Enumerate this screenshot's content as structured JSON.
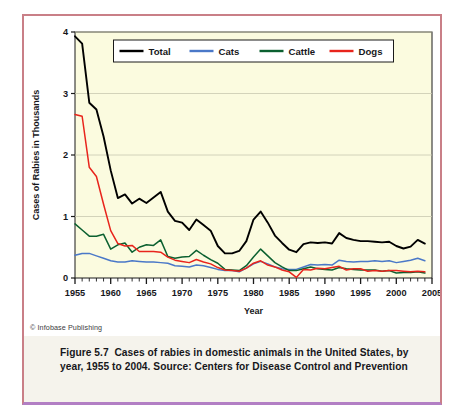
{
  "figure": {
    "label": "Figure 5.7",
    "caption": "Cases of rabies in domestic animals in the United States, by year, 1955 to 2004. Source: Centers for Disease Control and Prevention",
    "copyright": "© Infobase Publishing"
  },
  "colors": {
    "total": "#000000",
    "cats": "#4a78c8",
    "cattle": "#0b6030",
    "dogs": "#e8241c",
    "plot_background": "#fbfbdf",
    "gridline": "#c9c9b0",
    "axis": "#1a1a1a",
    "card_border": "#c97f87",
    "card_border_bottom": "#b27fc4",
    "caption_background": "#f5f3ec"
  },
  "chart_data": {
    "type": "line",
    "title": "",
    "xlabel": "Year",
    "ylabel": "Cases of Rabies in Thousands",
    "xlim": [
      1955,
      2005
    ],
    "ylim": [
      0,
      4
    ],
    "xticks": [
      1955,
      1960,
      1965,
      1970,
      1975,
      1980,
      1985,
      1990,
      1995,
      2000,
      2005
    ],
    "xtick_labels": [
      "1955",
      "1960",
      "1965",
      "1970",
      "1975",
      "1980",
      "1985",
      "1990",
      "1995",
      "2000",
      "2005"
    ],
    "yticks": [
      0,
      1,
      2,
      3,
      4
    ],
    "ytick_labels": [
      "0",
      "1",
      "2",
      "3",
      "4"
    ],
    "minor_xtick_interval": 1,
    "grid": "horizontal",
    "legend_position": "top-center",
    "x": [
      1955,
      1956,
      1957,
      1958,
      1959,
      1960,
      1961,
      1962,
      1963,
      1964,
      1965,
      1966,
      1967,
      1968,
      1969,
      1970,
      1971,
      1972,
      1973,
      1974,
      1975,
      1976,
      1977,
      1978,
      1979,
      1980,
      1981,
      1982,
      1983,
      1984,
      1985,
      1986,
      1987,
      1988,
      1989,
      1990,
      1991,
      1992,
      1993,
      1994,
      1995,
      1996,
      1997,
      1998,
      1999,
      2000,
      2001,
      2002,
      2003,
      2004
    ],
    "series": [
      {
        "name": "Total",
        "color": "#000000",
        "values": [
          3.93,
          3.81,
          2.85,
          2.74,
          2.3,
          1.75,
          1.3,
          1.36,
          1.21,
          1.29,
          1.22,
          1.31,
          1.4,
          1.08,
          0.93,
          0.9,
          0.78,
          0.95,
          0.86,
          0.77,
          0.52,
          0.4,
          0.4,
          0.44,
          0.6,
          0.95,
          1.08,
          0.9,
          0.69,
          0.57,
          0.46,
          0.42,
          0.55,
          0.58,
          0.57,
          0.58,
          0.56,
          0.73,
          0.65,
          0.62,
          0.6,
          0.6,
          0.59,
          0.58,
          0.59,
          0.52,
          0.48,
          0.51,
          0.62,
          0.56
        ]
      },
      {
        "name": "Cats",
        "color": "#4a78c8",
        "values": [
          0.37,
          0.4,
          0.4,
          0.36,
          0.32,
          0.28,
          0.26,
          0.26,
          0.28,
          0.27,
          0.26,
          0.26,
          0.25,
          0.24,
          0.2,
          0.19,
          0.18,
          0.21,
          0.2,
          0.17,
          0.14,
          0.12,
          0.12,
          0.1,
          0.16,
          0.23,
          0.27,
          0.23,
          0.18,
          0.15,
          0.14,
          0.14,
          0.18,
          0.22,
          0.21,
          0.22,
          0.21,
          0.29,
          0.27,
          0.26,
          0.27,
          0.27,
          0.28,
          0.27,
          0.28,
          0.25,
          0.27,
          0.29,
          0.32,
          0.28
        ]
      },
      {
        "name": "Cattle",
        "color": "#0b6030",
        "values": [
          0.88,
          0.78,
          0.68,
          0.68,
          0.71,
          0.47,
          0.54,
          0.57,
          0.42,
          0.5,
          0.54,
          0.53,
          0.62,
          0.35,
          0.32,
          0.34,
          0.35,
          0.45,
          0.37,
          0.3,
          0.24,
          0.14,
          0.13,
          0.12,
          0.2,
          0.34,
          0.47,
          0.36,
          0.25,
          0.18,
          0.12,
          0.12,
          0.15,
          0.18,
          0.15,
          0.14,
          0.13,
          0.17,
          0.15,
          0.14,
          0.13,
          0.13,
          0.13,
          0.11,
          0.12,
          0.08,
          0.09,
          0.09,
          0.1,
          0.08
        ]
      },
      {
        "name": "Dogs",
        "color": "#e8241c",
        "values": [
          2.66,
          2.63,
          1.8,
          1.65,
          1.2,
          0.77,
          0.56,
          0.52,
          0.53,
          0.43,
          0.43,
          0.43,
          0.42,
          0.34,
          0.29,
          0.27,
          0.25,
          0.3,
          0.26,
          0.23,
          0.17,
          0.13,
          0.12,
          0.11,
          0.16,
          0.24,
          0.28,
          0.21,
          0.18,
          0.13,
          0.1,
          0.01,
          0.14,
          0.13,
          0.16,
          0.15,
          0.17,
          0.19,
          0.13,
          0.15,
          0.15,
          0.11,
          0.12,
          0.11,
          0.12,
          0.12,
          0.11,
          0.1,
          0.11,
          0.1
        ]
      }
    ]
  }
}
